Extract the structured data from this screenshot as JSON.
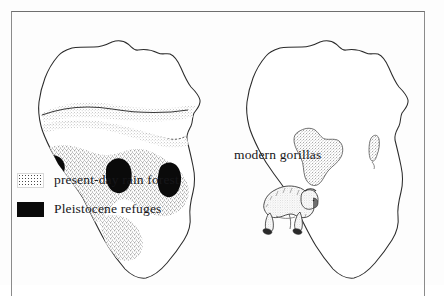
{
  "figure": {
    "kind": "two-panel map figure",
    "frame_color": "#8b8b8b",
    "background": "#ffffff"
  },
  "left_panel": {
    "name": "left-africa-map",
    "description": "Outline map of Africa with stippled present-day rain forest and solid black Pleistocene refuge patches",
    "stipple_color": "#5f5f5f",
    "refuge_color": "#0a0a0a",
    "outline_color": "#2b2b2b",
    "legend": {
      "items": [
        {
          "swatch": "stipple-swatch",
          "label": "present-day rain forest"
        },
        {
          "swatch": "black-swatch",
          "label": "Pleistocene refuges"
        }
      ]
    }
  },
  "right_panel": {
    "name": "right-africa-map",
    "description": "Outline map of Africa with stippled modern gorilla range in west-central Africa, stippled Madagascar, and a gorilla illustration",
    "range_label": "modern gorillas",
    "stipple_color": "#6a6a6a",
    "outline_color": "#2b2b2b",
    "illustration": "gorilla-knuckle-walking"
  }
}
